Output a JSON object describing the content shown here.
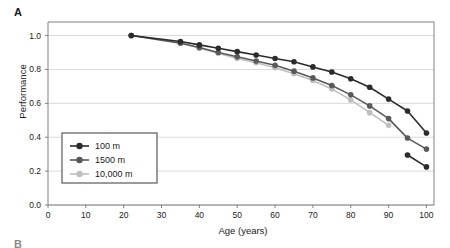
{
  "panel": {
    "letter": "A",
    "next_letter": "B"
  },
  "colors": {
    "series_100m": "#2b2b2b",
    "series_1500m": "#595959",
    "series_10000m": "#bfbfbf",
    "gridline": "#d9d9d9",
    "axis": "#808080",
    "text": "#1a1a1a",
    "legend_border": "#595959",
    "background": "#ffffff"
  },
  "chart_data": {
    "type": "line",
    "title": "",
    "xlabel": "Age (years)",
    "ylabel": "Performance",
    "xlim": [
      0,
      102
    ],
    "ylim": [
      0.0,
      1.08
    ],
    "xticks": [
      0,
      10,
      20,
      30,
      40,
      50,
      60,
      70,
      80,
      90,
      100
    ],
    "xtick_labels": [
      "0",
      "10",
      "20",
      "30",
      "40",
      "50",
      "60",
      "70",
      "80",
      "90",
      "100"
    ],
    "yticks": [
      0.0,
      0.2,
      0.4,
      0.6,
      0.8,
      1.0
    ],
    "ytick_labels": [
      "0.0",
      "0.2",
      "0.4",
      "0.6",
      "0.8",
      "1.0"
    ],
    "grid": "horizontal",
    "legend_position": "lower-left-inside",
    "markers": "filled-circle",
    "series": [
      {
        "name": "100 m",
        "color": "#2b2b2b",
        "x": [
          22,
          35,
          40,
          45,
          50,
          55,
          60,
          65,
          70,
          75,
          80,
          85,
          90,
          95,
          100
        ],
        "values": [
          1.0,
          0.965,
          0.945,
          0.925,
          0.905,
          0.885,
          0.865,
          0.845,
          0.815,
          0.785,
          0.745,
          0.695,
          0.625,
          0.555,
          0.425
        ]
      },
      {
        "name": "1500 m",
        "color": "#595959",
        "x": [
          22,
          35,
          40,
          45,
          50,
          55,
          60,
          65,
          70,
          75,
          80,
          85,
          90,
          95,
          100
        ],
        "values": [
          1.0,
          0.955,
          0.93,
          0.9,
          0.875,
          0.85,
          0.825,
          0.79,
          0.75,
          0.705,
          0.65,
          0.585,
          0.51,
          0.395,
          0.33
        ]
      },
      {
        "name": "10,000 m",
        "color": "#bfbfbf",
        "x": [
          22,
          35,
          40,
          45,
          50,
          55,
          60,
          65,
          70,
          75,
          80,
          85,
          90
        ],
        "values": [
          1.0,
          0.96,
          0.925,
          0.895,
          0.865,
          0.84,
          0.81,
          0.775,
          0.735,
          0.685,
          0.62,
          0.545,
          0.47
        ]
      }
    ],
    "extra_series": [
      {
        "name": "100 m tail",
        "color": "#2b2b2b",
        "x": [
          95,
          100
        ],
        "values": [
          0.295,
          0.225
        ]
      }
    ],
    "legend_entries": [
      "100 m",
      "1500 m",
      "10,000 m"
    ]
  }
}
